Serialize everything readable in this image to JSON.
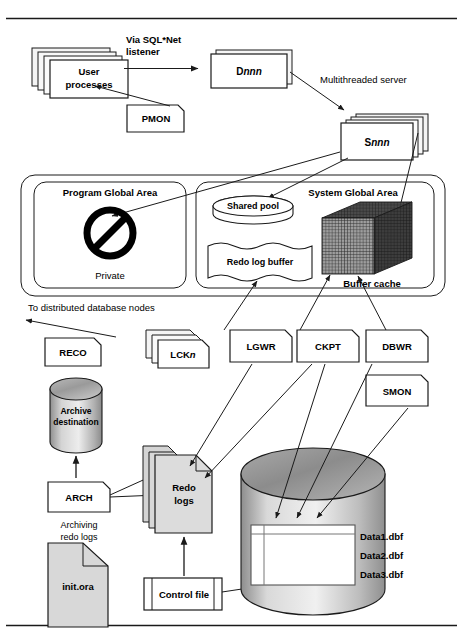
{
  "figure": {
    "frame": {
      "rule_color": "#111111"
    }
  },
  "colors": {
    "line": "#1a1a1a",
    "box_fill": "#ffffff",
    "shadow_fill": "#f2f2f2",
    "file_fill": "#d8d8d8",
    "cylinder_fill": "#b3b3b3",
    "cube_dark": "#3a3a3a",
    "cube_face": "#9a9a9a",
    "text": "#000000"
  },
  "top_tier": {
    "user_processes": {
      "label_line1": "User",
      "label_line2": "processes",
      "stacked": true
    },
    "pmon": {
      "label": "PMON"
    },
    "sqlnet_note": {
      "line1": "Via SQL*Net",
      "line2": "listener"
    },
    "dispatcher": {
      "label_prefix": "D",
      "label_suffix": "nnn",
      "stacked": true
    },
    "mts_note": {
      "label": "Multithreaded server"
    },
    "server": {
      "label_prefix": "S",
      "label_suffix": "nnn",
      "stacked": true
    }
  },
  "memory": {
    "pga": {
      "title": "Program Global Area",
      "caption": "Private",
      "icon": "no-entry-icon"
    },
    "sga": {
      "title": "System Global Area",
      "shared_pool": {
        "label": "Shared pool"
      },
      "redo_log_buffer": {
        "label": "Redo log buffer"
      },
      "buffer_cache": {
        "label": "Buffer cache"
      }
    }
  },
  "background_processes": {
    "reco": {
      "label": "RECO"
    },
    "lck": {
      "label_prefix": "LCK",
      "label_suffix": "n",
      "stacked": true
    },
    "lgwr": {
      "label": "LGWR"
    },
    "ckpt": {
      "label": "CKPT"
    },
    "dbwr": {
      "label": "DBWR"
    },
    "smon": {
      "label": "SMON"
    },
    "arch": {
      "label": "ARCH"
    },
    "distributed_note": {
      "label": "To distributed database nodes"
    },
    "archiving_note": {
      "line1": "Archiving",
      "line2": "redo logs"
    }
  },
  "storage": {
    "archive_destination": {
      "label_line1": "Archive",
      "label_line2": "destination"
    },
    "redo_logs": {
      "label_line1": "Redo",
      "label_line2": "logs",
      "stacked": true
    },
    "init_ora": {
      "label": "init.ora"
    },
    "control_file": {
      "label": "Control file"
    },
    "database": {
      "datafiles": [
        "Data1.dbf",
        "Data2.dbf",
        "Data3.dbf"
      ]
    }
  }
}
